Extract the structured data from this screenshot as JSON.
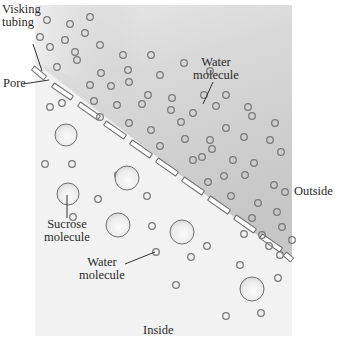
{
  "diagram": {
    "panel": {
      "x": 35,
      "y": 5,
      "w": 257,
      "h": 331
    },
    "colors": {
      "outside_fill_top": "#c9c9c9",
      "outside_fill_bottom": "#e6e6e6",
      "inside_fill": "#f3f3f3",
      "molecule_stroke": "#7a7a7a",
      "sucrose_fill": "#e9e9e9",
      "membrane_stroke": "#6e6e6e",
      "label_color": "#2a2a2a"
    },
    "regions": {
      "outside": "Outside",
      "inside": "Inside"
    },
    "labels": {
      "visking_line1": "Visking",
      "visking_line2": "tubing",
      "pore": "Pore",
      "water_top_line1": "Water",
      "water_top_line2": "molecule",
      "sucrose_line1": "Sucrose",
      "sucrose_line2": "molecule",
      "water_bottom_line1": "Water",
      "water_bottom_line2": "molecule"
    },
    "membrane_segments": [
      [
        33,
        68,
        45,
        78
      ],
      [
        53,
        85,
        72,
        98
      ],
      [
        79,
        104,
        99,
        118
      ],
      [
        105,
        123,
        125,
        137
      ],
      [
        131,
        142,
        151,
        156
      ],
      [
        157,
        160,
        177,
        174
      ],
      [
        183,
        179,
        203,
        193
      ],
      [
        209,
        198,
        229,
        212
      ],
      [
        235,
        217,
        255,
        231
      ],
      [
        261,
        236,
        281,
        250
      ],
      [
        285,
        254,
        292,
        260
      ]
    ],
    "water_outside": [
      [
        47,
        20
      ],
      [
        70,
        24
      ],
      [
        90,
        17
      ],
      [
        40,
        37
      ],
      [
        65,
        40
      ],
      [
        85,
        33
      ],
      [
        50,
        47
      ],
      [
        75,
        52
      ],
      [
        100,
        45
      ],
      [
        123,
        55
      ],
      [
        151,
        55
      ],
      [
        57,
        67
      ],
      [
        77,
        60
      ],
      [
        101,
        73
      ],
      [
        128,
        70
      ],
      [
        160,
        75
      ],
      [
        184,
        63
      ],
      [
        210,
        71
      ],
      [
        90,
        85
      ],
      [
        111,
        86
      ],
      [
        129,
        82
      ],
      [
        148,
        95
      ],
      [
        172,
        98
      ],
      [
        204,
        95
      ],
      [
        226,
        95
      ],
      [
        62,
        103
      ],
      [
        94,
        101
      ],
      [
        117,
        105
      ],
      [
        142,
        104
      ],
      [
        171,
        110
      ],
      [
        193,
        113
      ],
      [
        216,
        106
      ],
      [
        248,
        107
      ],
      [
        100,
        117
      ],
      [
        129,
        123
      ],
      [
        151,
        130
      ],
      [
        181,
        122
      ],
      [
        210,
        140
      ],
      [
        226,
        128
      ],
      [
        252,
        116
      ],
      [
        275,
        123
      ],
      [
        160,
        146
      ],
      [
        185,
        139
      ],
      [
        202,
        157
      ],
      [
        244,
        137
      ],
      [
        270,
        140
      ],
      [
        193,
        160
      ],
      [
        212,
        149
      ],
      [
        233,
        160
      ],
      [
        254,
        163
      ],
      [
        281,
        152
      ],
      [
        224,
        176
      ],
      [
        245,
        175
      ],
      [
        274,
        185
      ],
      [
        208,
        182
      ],
      [
        258,
        203
      ],
      [
        285,
        192
      ],
      [
        231,
        196
      ],
      [
        252,
        218
      ],
      [
        277,
        212
      ],
      [
        282,
        227
      ],
      [
        244,
        234
      ],
      [
        262,
        235
      ],
      [
        269,
        246
      ],
      [
        280,
        255
      ],
      [
        292,
        240
      ]
    ],
    "water_inside": [
      [
        50,
        107
      ],
      [
        45,
        164
      ],
      [
        72,
        164
      ],
      [
        98,
        199
      ],
      [
        118,
        175
      ],
      [
        147,
        196
      ],
      [
        156,
        252
      ],
      [
        73,
        217
      ],
      [
        152,
        226
      ],
      [
        183,
        227
      ],
      [
        191,
        257
      ],
      [
        207,
        246
      ],
      [
        176,
        285
      ],
      [
        240,
        265
      ],
      [
        246,
        289
      ],
      [
        278,
        278
      ],
      [
        226,
        316
      ],
      [
        261,
        313
      ]
    ],
    "sucrose_inside": [
      [
        66,
        135,
        11
      ],
      [
        127,
        178,
        12
      ],
      [
        68,
        194,
        11
      ],
      [
        118,
        225,
        12
      ],
      [
        182,
        232,
        12
      ],
      [
        252,
        289,
        12
      ],
      [
        56,
        257,
        0
      ]
    ]
  }
}
